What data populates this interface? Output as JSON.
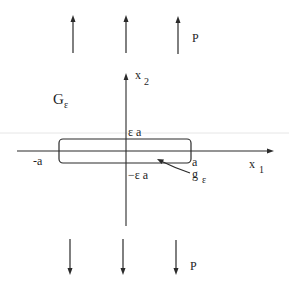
{
  "figure": {
    "region_label": {
      "main": "G",
      "sub": "ε"
    },
    "boundary_label": {
      "main": "g",
      "sub": "ε"
    },
    "axes": {
      "horizontal": {
        "main": "x",
        "sub": "1"
      },
      "vertical": {
        "main": "x",
        "sub": "2"
      }
    },
    "tick_labels": {
      "left": "-a",
      "right": "a",
      "top": "ε a",
      "bottom": "−ε a"
    },
    "top_loads": {
      "label": "P",
      "count": 3,
      "direction": "up"
    },
    "bottom_loads": {
      "label": "P",
      "count": 3,
      "direction": "down"
    },
    "colors": {
      "ink": "#2a2a2a",
      "background": "#ffffff"
    }
  }
}
